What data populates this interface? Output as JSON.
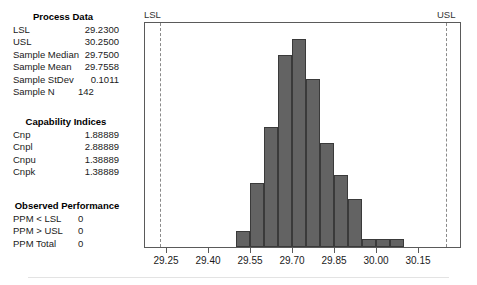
{
  "panels": {
    "process_data": {
      "title": "Process Data",
      "rows": [
        {
          "label": "LSL",
          "value": "29.2300"
        },
        {
          "label": "USL",
          "value": "30.2500"
        },
        {
          "label": "Sample Median",
          "value": "29.7500"
        },
        {
          "label": "Sample Mean",
          "value": "29.7558"
        },
        {
          "label": "Sample StDev",
          "value": "0.1011"
        },
        {
          "label": "Sample N",
          "value": "142"
        }
      ]
    },
    "capability_indices": {
      "title": "Capability Indices",
      "rows": [
        {
          "label": "Cnp",
          "value": "1.88889"
        },
        {
          "label": "Cnpl",
          "value": "2.88889"
        },
        {
          "label": "Cnpu",
          "value": "1.38889"
        },
        {
          "label": "Cnpk",
          "value": "1.38889"
        }
      ]
    },
    "observed_performance": {
      "title": "Observed Performance",
      "rows": [
        {
          "label": "PPM < LSL",
          "value": "0"
        },
        {
          "label": "PPM > USL",
          "value": "0"
        },
        {
          "label": "PPM Total",
          "value": "0"
        }
      ]
    }
  },
  "chart_data": {
    "type": "bar",
    "title": "",
    "xlabel": "",
    "ylabel": "",
    "xlim": [
      29.175,
      30.3
    ],
    "ylim": [
      0,
      28
    ],
    "grid": false,
    "legend": null,
    "bar_color": "#636363",
    "bar_edge_color": "#3a3a3a",
    "bin_width": 0.05,
    "tick_labels": [
      "29.25",
      "29.40",
      "29.55",
      "29.70",
      "29.85",
      "30.00",
      "30.15"
    ],
    "tick_values": [
      29.25,
      29.4,
      29.55,
      29.7,
      29.85,
      30.0,
      30.15
    ],
    "bins": [
      {
        "left": 29.5,
        "right": 29.55,
        "count": 2
      },
      {
        "left": 29.55,
        "right": 29.6,
        "count": 8
      },
      {
        "left": 29.6,
        "right": 29.65,
        "count": 15
      },
      {
        "left": 29.65,
        "right": 29.7,
        "count": 24
      },
      {
        "left": 29.7,
        "right": 29.75,
        "count": 26
      },
      {
        "left": 29.75,
        "right": 29.8,
        "count": 21
      },
      {
        "left": 29.8,
        "right": 29.85,
        "count": 13
      },
      {
        "left": 29.85,
        "right": 29.9,
        "count": 9
      },
      {
        "left": 29.9,
        "right": 29.95,
        "count": 6
      },
      {
        "left": 29.95,
        "right": 30.0,
        "count": 1
      },
      {
        "left": 30.0,
        "right": 30.05,
        "count": 1
      },
      {
        "left": 30.05,
        "right": 30.1,
        "count": 1
      }
    ],
    "spec_limits": [
      {
        "name": "LSL",
        "value": 29.23,
        "label": "LSL",
        "style": "dashed"
      },
      {
        "name": "USL",
        "value": 30.25,
        "label": "USL",
        "style": "dashed"
      }
    ]
  }
}
